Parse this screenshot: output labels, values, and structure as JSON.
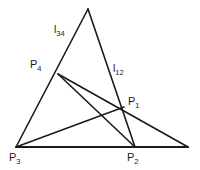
{
  "figure": {
    "type": "geometric-diagram",
    "background_color": "#ffffff",
    "stroke_color": "#1a1a1a",
    "width": 200,
    "height": 170
  },
  "points": [
    {
      "id": "apex",
      "label": "",
      "sub": "",
      "x": 88,
      "y": 9,
      "label_x": 0,
      "label_y": 0
    },
    {
      "id": "P1",
      "label": "P",
      "sub": "1",
      "x": 124,
      "y": 107,
      "label_x": 128,
      "label_y": 96
    },
    {
      "id": "P2",
      "label": "P",
      "sub": "2",
      "x": 135,
      "y": 147,
      "label_x": 127,
      "label_y": 152
    },
    {
      "id": "P3",
      "label": "P",
      "sub": "3",
      "x": 16,
      "y": 147,
      "label_x": 9,
      "label_y": 152
    },
    {
      "id": "P4",
      "label": "P",
      "sub": "4",
      "x": 58,
      "y": 74,
      "label_x": 30,
      "label_y": 59
    },
    {
      "id": "Rend",
      "label": "",
      "sub": "",
      "x": 188,
      "y": 147,
      "label_x": 0,
      "label_y": 0
    }
  ],
  "line_labels": [
    {
      "id": "l34",
      "label": "l",
      "sub": "34",
      "x": 54,
      "y": 24
    },
    {
      "id": "l12",
      "label": "l",
      "sub": "12",
      "x": 113,
      "y": 63
    }
  ],
  "segments": [
    {
      "id": "left-edge",
      "from": "P3",
      "to": "apex",
      "width": 1.6
    },
    {
      "id": "right-edge-l12",
      "from": "apex",
      "to": "P2",
      "width": 1.6
    },
    {
      "id": "baseline",
      "from": "P3",
      "to": "Rend",
      "width": 1.9
    },
    {
      "id": "P4-to-Rend",
      "from": "P4",
      "to": "Rend",
      "width": 1.6
    },
    {
      "id": "P4-to-P2",
      "from": "P4",
      "to": "P2",
      "width": 1.6
    },
    {
      "id": "P3-to-P1-ext",
      "from": "P3",
      "to": "P1",
      "width": 1.6
    }
  ]
}
